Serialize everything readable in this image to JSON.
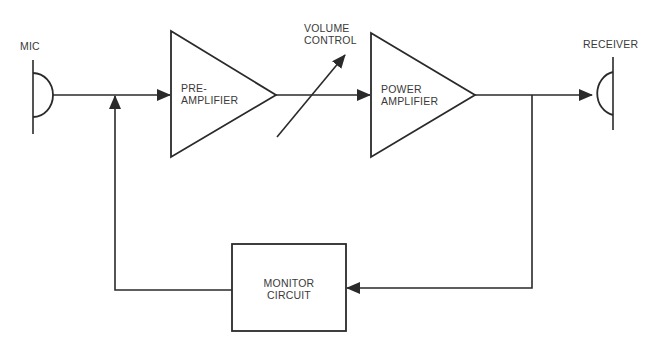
{
  "diagram": {
    "type": "block-diagram",
    "stroke_color": "#2a2a2a",
    "background": "#ffffff",
    "nodes": {
      "mic": {
        "label": "MIC",
        "symbol": "microphone"
      },
      "preamp": {
        "line1": "PRE-",
        "line2": "AMPLIFIER",
        "symbol": "amplifier-triangle"
      },
      "volume": {
        "line1": "VOLUME",
        "line2": "CONTROL",
        "symbol": "variable-arrow"
      },
      "poweramp": {
        "line1": "POWER",
        "line2": "AMPLIFIER",
        "symbol": "amplifier-triangle"
      },
      "receiver": {
        "label": "RECEIVER",
        "symbol": "earpiece"
      },
      "monitor": {
        "line1": "MONITOR",
        "line2": "CIRCUIT",
        "symbol": "box"
      }
    },
    "edges": [
      {
        "from": "mic",
        "to": "preamp"
      },
      {
        "from": "preamp",
        "to": "poweramp",
        "via": "volume"
      },
      {
        "from": "poweramp",
        "to": "receiver"
      },
      {
        "from": "poweramp",
        "to": "monitor",
        "type": "feedback-tap"
      },
      {
        "from": "monitor",
        "to": "mic-preamp-junction",
        "type": "feedback"
      }
    ]
  }
}
